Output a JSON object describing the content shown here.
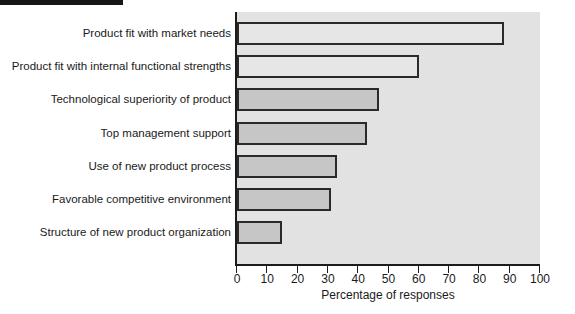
{
  "chart_data": {
    "type": "bar",
    "orientation": "horizontal",
    "title": "",
    "xlabel": "Percentage of responses",
    "ylabel": "",
    "xlim": [
      0,
      100
    ],
    "xticks": [
      0,
      10,
      20,
      30,
      40,
      50,
      60,
      70,
      80,
      90,
      100
    ],
    "xtick_labels": [
      "0",
      "10",
      "20",
      "30",
      "40",
      "50",
      "60",
      "70",
      "80",
      "90",
      "100"
    ],
    "grid": false,
    "legend": null,
    "categories": [
      "Product fit with market needs",
      "Product fit with internal functional strengths",
      "Technological superiority of product",
      "Top management support",
      "Use of new product process",
      "Favorable competitive environment",
      "Structure of new product organization"
    ],
    "values": [
      88,
      60,
      47,
      43,
      33,
      31,
      15
    ],
    "bar_styles": [
      "light",
      "light",
      "dark",
      "dark",
      "dark",
      "dark",
      "dark"
    ],
    "colors": {
      "bar_light_fill": "#e6e6e6",
      "bar_dark_fill": "#c6c6c6",
      "bar_edge": "#2a2a2a",
      "plot_background": "#e2e2e2",
      "axis": "#1c1c1c",
      "text": "#1a1a1a",
      "figure_background": "#ffffff"
    }
  },
  "axis": {
    "x_title": "Percentage of responses"
  },
  "artifact": {
    "name": "scan-edge-mark"
  }
}
